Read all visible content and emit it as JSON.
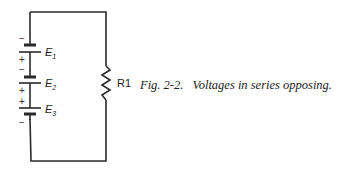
{
  "figure": {
    "number": "Fig. 2-2.",
    "caption": "Voltages in series opposing."
  },
  "components": {
    "sources": [
      {
        "label": "E",
        "subscript": "1",
        "top_sign": "−",
        "bottom_sign": "+"
      },
      {
        "label": "E",
        "subscript": "2",
        "top_sign": "−",
        "bottom_sign": "+"
      },
      {
        "label": "E",
        "subscript": "3",
        "top_sign": "+",
        "bottom_sign": "−"
      }
    ],
    "resistor": {
      "label": "R1"
    }
  }
}
